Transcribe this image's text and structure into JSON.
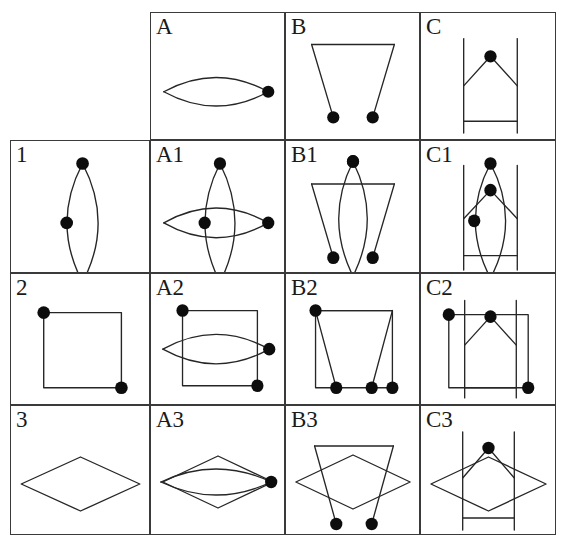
{
  "figure": {
    "type": "matrix-grid-diagram",
    "width": 571,
    "height": 541,
    "rows": 4,
    "columns": 4,
    "background_color": "#ffffff",
    "line_color": "#262626",
    "grid_color": "#3a3a3a",
    "dot_color": "#0d0d0d"
  },
  "grid": {
    "left": 10,
    "top": 12,
    "right": 556,
    "bottom": 535,
    "column_edges": [
      10,
      150,
      285,
      420,
      556
    ],
    "row_edges": [
      12,
      140,
      273,
      405,
      535
    ]
  },
  "labels": {
    "corner": "",
    "columns": [
      "A",
      "B",
      "C"
    ],
    "rows": [
      "1",
      "2",
      "3"
    ],
    "combined": [
      [
        "A1",
        "B1",
        "C1"
      ],
      [
        "A2",
        "B2",
        "C2"
      ],
      [
        "A3",
        "B3",
        "C3"
      ]
    ]
  },
  "cells": [
    {
      "id": "corner",
      "label": "",
      "row": 0,
      "col": 0,
      "shapes": [],
      "bordered": false
    },
    {
      "id": "A",
      "label": "A",
      "row": 0,
      "col": 1,
      "shapes": [
        "lens-horizontal"
      ],
      "dots": 1
    },
    {
      "id": "B",
      "label": "B",
      "row": 0,
      "col": 2,
      "shapes": [
        "trapezoid-open"
      ],
      "dots": 2
    },
    {
      "id": "C",
      "label": "C",
      "row": 0,
      "col": 3,
      "shapes": [
        "rails-peak"
      ],
      "dots": 1
    },
    {
      "id": "1",
      "label": "1",
      "row": 1,
      "col": 0,
      "shapes": [
        "lens-vertical"
      ],
      "dots": 2
    },
    {
      "id": "A1",
      "label": "A1",
      "row": 1,
      "col": 1,
      "shapes": [
        "lens-vertical",
        "lens-horizontal"
      ],
      "dots": 3
    },
    {
      "id": "B1",
      "label": "B1",
      "row": 1,
      "col": 2,
      "shapes": [
        "lens-vertical",
        "trapezoid-open"
      ],
      "dots": 3
    },
    {
      "id": "C1",
      "label": "C1",
      "row": 1,
      "col": 3,
      "shapes": [
        "lens-vertical",
        "rails-peak"
      ],
      "dots": 3
    },
    {
      "id": "2",
      "label": "2",
      "row": 2,
      "col": 0,
      "shapes": [
        "square"
      ],
      "dots": 2
    },
    {
      "id": "A2",
      "label": "A2",
      "row": 2,
      "col": 1,
      "shapes": [
        "square",
        "lens-horizontal"
      ],
      "dots": 3
    },
    {
      "id": "B2",
      "label": "B2",
      "row": 2,
      "col": 2,
      "shapes": [
        "square",
        "trapezoid-open"
      ],
      "dots": 4
    },
    {
      "id": "C2",
      "label": "C2",
      "row": 2,
      "col": 3,
      "shapes": [
        "square",
        "rails-peak"
      ],
      "dots": 3
    },
    {
      "id": "3",
      "label": "3",
      "row": 3,
      "col": 0,
      "shapes": [
        "rhombus"
      ],
      "dots": 0
    },
    {
      "id": "A3",
      "label": "A3",
      "row": 3,
      "col": 1,
      "shapes": [
        "rhombus",
        "lens-horizontal"
      ],
      "dots": 1
    },
    {
      "id": "B3",
      "label": "B3",
      "row": 3,
      "col": 2,
      "shapes": [
        "rhombus",
        "trapezoid-open"
      ],
      "dots": 2
    },
    {
      "id": "C3",
      "label": "C3",
      "row": 3,
      "col": 3,
      "shapes": [
        "rhombus",
        "rails-peak"
      ],
      "dots": 1
    }
  ],
  "shape_definitions": {
    "lens-horizontal": "Two circular arcs meeting at left and right vertices forming a horizontal lens (bigon); filled dot at right vertex.",
    "lens-vertical": "Two circular arcs meeting at top and bottom vertices forming a vertical lens (bigon); filled dots at top vertex and on left arc at mid height.",
    "trapezoid-open": "Horizontal top edge with two legs slanting down and inward, open at bottom; filled dots at the two lower leg ends.",
    "rails-peak": "Two vertical parallel lines joined at top by an inverted-V peak, with a horizontal crossbar near the bottom; filled dot at the apex.",
    "square": "Axis-aligned square outline; filled dots at top-left and bottom-right corners.",
    "rhombus": "Wide diamond / rhombus outline; no dots."
  }
}
